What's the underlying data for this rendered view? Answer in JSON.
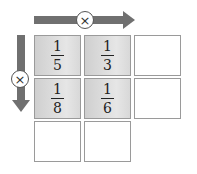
{
  "operator_symbol": "×",
  "operators": {
    "horizontal": {
      "symbol": "×",
      "direction": "right"
    },
    "vertical": {
      "symbol": "×",
      "direction": "down"
    }
  },
  "grid": {
    "rows": [
      [
        {
          "num": "1",
          "den": "5"
        },
        {
          "num": "1",
          "den": "3"
        },
        null
      ],
      [
        {
          "num": "1",
          "den": "8"
        },
        {
          "num": "1",
          "den": "6"
        },
        null
      ],
      [
        null,
        null
      ]
    ]
  },
  "colors": {
    "arrow": "#707070",
    "cell_border": "#9a9a9a",
    "filled_cell": "#d8d8d8"
  }
}
